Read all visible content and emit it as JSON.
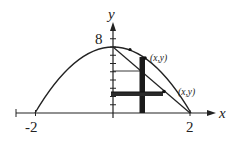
{
  "diagram": {
    "title": "",
    "curve": {
      "equation": "y = 8 - 2x^2",
      "x_from": -2,
      "x_to": 2
    },
    "line": {
      "from": [
        0,
        8
      ],
      "to": [
        2,
        0
      ]
    },
    "axes": {
      "x_label": "x",
      "y_label": "y",
      "x_ticks": [
        "-2",
        "2"
      ],
      "y_ticks": [
        "8"
      ]
    },
    "labels": {
      "point_upper": "(x,y)",
      "point_lower": "(x,y)"
    },
    "vertical_strip": {
      "x": 0.75,
      "y_top": 6.875,
      "y_bottom": 0
    },
    "horizontal_strip": {
      "y": 2.3,
      "x_left": 0,
      "x_right": 1.32
    },
    "colors": {
      "ink": "#222222",
      "background": "#ffffff"
    }
  }
}
